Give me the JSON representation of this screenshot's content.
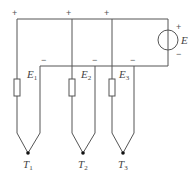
{
  "diagram": {
    "type": "circuit",
    "source": {
      "label": "E",
      "plus": "+",
      "minus": "−"
    },
    "thermocouples": [
      {
        "label": "T",
        "sub": "1",
        "emf_label": "E",
        "emf_sub": "1",
        "plus": "+",
        "minus": "−"
      },
      {
        "label": "T",
        "sub": "2",
        "emf_label": "E",
        "emf_sub": "2",
        "plus": "+",
        "minus": "−"
      },
      {
        "label": "T",
        "sub": "3",
        "emf_label": "E",
        "emf_sub": "3",
        "plus": "+",
        "minus": "−"
      }
    ],
    "colors": {
      "wire": "#555555",
      "text": "#444444",
      "background": "#ffffff"
    }
  }
}
